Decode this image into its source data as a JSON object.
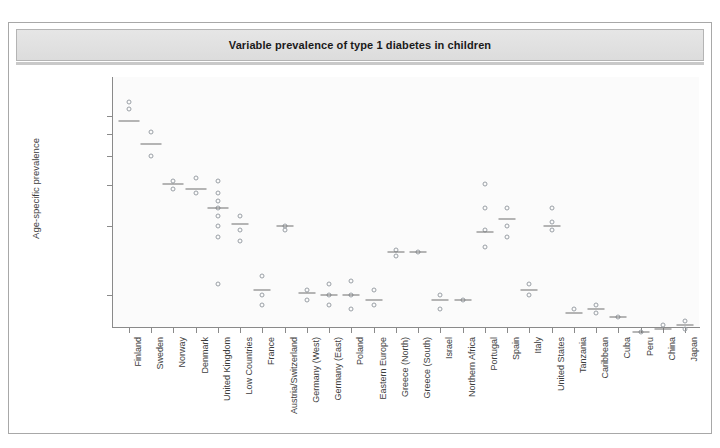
{
  "figure": {
    "title": "Variable prevalence of type 1 diabetes in children"
  },
  "chart_data": {
    "type": "scatter",
    "title": "Variable prevalence of type 1 diabetes in children",
    "xlabel": "",
    "ylabel": "Age-specific prevalence",
    "grid": false,
    "legend": "none",
    "yaxis": {
      "scale": "reciprocal-log",
      "tick_labels": [
        "1/167",
        "1/200",
        "1/250",
        "1/333",
        "1/500",
        "1/1000"
      ],
      "tick_values": [
        167,
        200,
        250,
        333,
        500,
        1000
      ]
    },
    "categories": [
      "Finland",
      "Sweden",
      "Norway",
      "Denmark",
      "United Kingdom",
      "Low Countries",
      "France",
      "Austria/Switzerland",
      "Germany (West)",
      "Germany (East)",
      "Poland",
      "Eastern Europe",
      "Greece (North)",
      "Greece (South)",
      "Israel",
      "Northern Africa",
      "Portugal",
      "Spain",
      "Italy",
      "United States",
      "Tanzania",
      "Caribbean",
      "Cuba",
      "Peru",
      "China",
      "Japan"
    ],
    "series": [
      {
        "name": "Finland",
        "points": [
          "1/145",
          "1/155"
        ],
        "mean": "1/175"
      },
      {
        "name": "Sweden",
        "points": [
          "1/195",
          "1/250"
        ],
        "mean": "1/222"
      },
      {
        "name": "Norway",
        "points": [
          "1/320",
          "1/345"
        ],
        "mean": "1/330"
      },
      {
        "name": "Denmark",
        "points": [
          "1/310",
          "1/360"
        ],
        "mean": "1/345"
      },
      {
        "name": "United Kingdom",
        "points": [
          "1/320",
          "1/360",
          "1/390",
          "1/420",
          "1/455",
          "1/500",
          "1/560",
          "1/900"
        ],
        "mean": "1/420"
      },
      {
        "name": "Low Countries",
        "points": [
          "1/455",
          "1/520",
          "1/580"
        ],
        "mean": "1/490"
      },
      {
        "name": "France",
        "points": [
          "1/830",
          "1/1000",
          "1/1100"
        ],
        "mean": "1/950"
      },
      {
        "name": "Austria/Switzerland",
        "points": [
          "1/500",
          "1/520"
        ],
        "mean": "1/500"
      },
      {
        "name": "Germany (West)",
        "points": [
          "1/950",
          "1/1050"
        ],
        "mean": "1/980"
      },
      {
        "name": "Germany (East)",
        "points": [
          "1/900",
          "1/1000",
          "1/1100"
        ],
        "mean": "1/1000"
      },
      {
        "name": "Poland",
        "points": [
          "1/870",
          "1/1000",
          "1/1150"
        ],
        "mean": "1/1000"
      },
      {
        "name": "Eastern Europe",
        "points": [
          "1/950",
          "1/1100"
        ],
        "mean": "1/1050"
      },
      {
        "name": "Greece (North)",
        "points": [
          "1/640",
          "1/680"
        ],
        "mean": "1/650"
      },
      {
        "name": "Greece (South)",
        "points": [
          "1/650"
        ],
        "mean": "1/650"
      },
      {
        "name": "Israel",
        "points": [
          "1/1000",
          "1/1150"
        ],
        "mean": "1/1050"
      },
      {
        "name": "Northern Africa",
        "points": [
          "1/1050"
        ],
        "mean": "1/1050"
      },
      {
        "name": "Portugal",
        "points": [
          "1/330",
          "1/420",
          "1/520",
          "1/620"
        ],
        "mean": "1/530"
      },
      {
        "name": "Spain",
        "points": [
          "1/420",
          "1/500",
          "1/560"
        ],
        "mean": "1/470"
      },
      {
        "name": "Italy",
        "points": [
          "1/900",
          "1/1000"
        ],
        "mean": "1/950"
      },
      {
        "name": "United States",
        "points": [
          "1/420",
          "1/480",
          "1/520"
        ],
        "mean": "1/500"
      },
      {
        "name": "Tanzania",
        "points": [
          "1/1150"
        ],
        "mean": "1/1200"
      },
      {
        "name": "Caribbean",
        "points": [
          "1/1100",
          "1/1200"
        ],
        "mean": "1/1150"
      },
      {
        "name": "Cuba",
        "points": [
          "1/1250"
        ],
        "mean": "1/1250"
      },
      {
        "name": "Peru",
        "points": [
          "1/1450"
        ],
        "mean": "1/1450"
      },
      {
        "name": "China",
        "points": [
          "1/1350"
        ],
        "mean": "1/1400"
      },
      {
        "name": "Japan",
        "points": [
          "1/1300",
          "1/1400"
        ],
        "mean": "1/1350"
      }
    ]
  }
}
